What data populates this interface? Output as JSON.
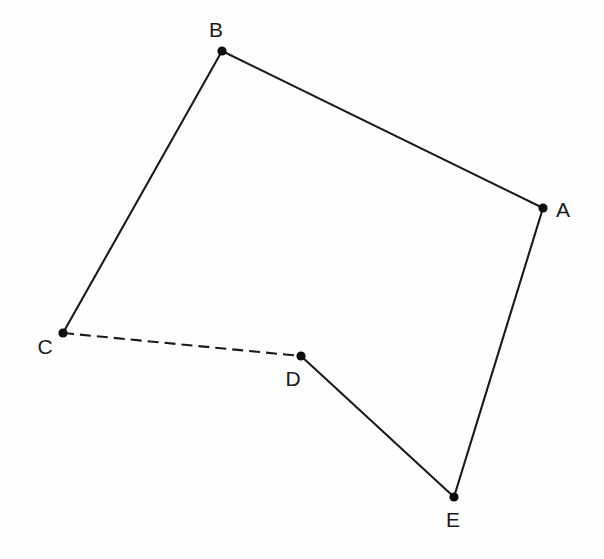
{
  "figure": {
    "background_color": "#fefefe",
    "stroke_color": "#1a1a1a",
    "dot_color": "#0d0d0d",
    "canvas": {
      "width": 604,
      "height": 559
    },
    "points": [
      {
        "id": "A",
        "label": "A",
        "x": 543,
        "y": 208,
        "label_x": 563,
        "label_y": 211,
        "dot_radius": 4.6
      },
      {
        "id": "B",
        "label": "B",
        "x": 222,
        "y": 51,
        "label_x": 216,
        "label_y": 31,
        "dot_radius": 4.6
      },
      {
        "id": "C",
        "label": "C",
        "x": 63,
        "y": 333,
        "label_x": 45,
        "label_y": 348,
        "dot_radius": 4.6
      },
      {
        "id": "D",
        "label": "D",
        "x": 301,
        "y": 356,
        "label_x": 293,
        "label_y": 380,
        "dot_radius": 4.6
      },
      {
        "id": "E",
        "label": "E",
        "x": 454,
        "y": 497,
        "label_x": 453,
        "label_y": 521,
        "dot_radius": 4.6
      }
    ],
    "segments": [
      {
        "id": "AB",
        "from": "B",
        "to": "A",
        "style": "solid",
        "x1": 222,
        "y1": 51,
        "x2": 543,
        "y2": 208
      },
      {
        "id": "BC",
        "from": "B",
        "to": "C",
        "style": "solid",
        "x1": 222,
        "y1": 51,
        "x2": 63,
        "y2": 333
      },
      {
        "id": "CD",
        "from": "C",
        "to": "D",
        "style": "dashed",
        "x1": 63,
        "y1": 333,
        "x2": 301,
        "y2": 356
      },
      {
        "id": "DE",
        "from": "D",
        "to": "E",
        "style": "solid",
        "x1": 301,
        "y1": 356,
        "x2": 454,
        "y2": 497
      },
      {
        "id": "EA",
        "from": "E",
        "to": "A",
        "style": "solid",
        "x1": 454,
        "y1": 497,
        "x2": 543,
        "y2": 208
      }
    ]
  }
}
